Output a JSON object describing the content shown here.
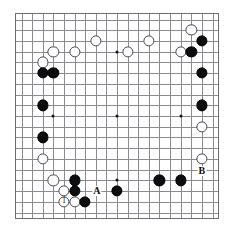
{
  "diagram": {
    "type": "go-board-diagram",
    "board_size": 19,
    "colors": {
      "board_background": "#ffffff",
      "grid_line": "#8a8a90",
      "border": "#6b6b73",
      "black_stone": "#0d0d10",
      "white_stone": "#ffffff",
      "white_stone_outline": "#4a4a52",
      "label_text": "#0d0d10"
    },
    "star_points": [
      {
        "col": 3,
        "row": 3
      },
      {
        "col": 9,
        "row": 3
      },
      {
        "col": 15,
        "row": 3
      },
      {
        "col": 3,
        "row": 9
      },
      {
        "col": 9,
        "row": 9
      },
      {
        "col": 15,
        "row": 9
      },
      {
        "col": 3,
        "row": 15
      },
      {
        "col": 9,
        "row": 15
      },
      {
        "col": 15,
        "row": 15
      }
    ],
    "stones": [
      {
        "col": 16,
        "row": 1,
        "color": "white",
        "label": ""
      },
      {
        "col": 17,
        "row": 2,
        "color": "black",
        "label": ""
      },
      {
        "col": 7,
        "row": 2,
        "color": "white",
        "label": ""
      },
      {
        "col": 12,
        "row": 2,
        "color": "white",
        "label": ""
      },
      {
        "col": 3,
        "row": 3,
        "color": "white",
        "label": ""
      },
      {
        "col": 5,
        "row": 3,
        "color": "white",
        "label": ""
      },
      {
        "col": 10,
        "row": 3,
        "color": "white",
        "label": ""
      },
      {
        "col": 15,
        "row": 3,
        "color": "white",
        "label": ""
      },
      {
        "col": 16,
        "row": 3,
        "color": "black",
        "label": ""
      },
      {
        "col": 2,
        "row": 4,
        "color": "white",
        "label": ""
      },
      {
        "col": 2,
        "row": 5,
        "color": "black",
        "label": ""
      },
      {
        "col": 3,
        "row": 5,
        "color": "black",
        "label": ""
      },
      {
        "col": 17,
        "row": 5,
        "color": "black",
        "label": ""
      },
      {
        "col": 2,
        "row": 8,
        "color": "black",
        "label": ""
      },
      {
        "col": 17,
        "row": 8,
        "color": "black",
        "label": ""
      },
      {
        "col": 17,
        "row": 10,
        "color": "white",
        "label": ""
      },
      {
        "col": 2,
        "row": 11,
        "color": "black",
        "label": ""
      },
      {
        "col": 2,
        "row": 13,
        "color": "white",
        "label": ""
      },
      {
        "col": 17,
        "row": 13,
        "color": "white",
        "label": ""
      },
      {
        "col": 3,
        "row": 15,
        "color": "white",
        "label": ""
      },
      {
        "col": 5,
        "row": 15,
        "color": "black",
        "label": ""
      },
      {
        "col": 13,
        "row": 15,
        "color": "black",
        "label": ""
      },
      {
        "col": 15,
        "row": 15,
        "color": "black",
        "label": ""
      },
      {
        "col": 4,
        "row": 16,
        "color": "white",
        "label": ""
      },
      {
        "col": 5,
        "row": 16,
        "color": "black",
        "label": ""
      },
      {
        "col": 9,
        "row": 16,
        "color": "black",
        "label": ""
      },
      {
        "col": 4,
        "row": 17,
        "color": "white",
        "label": "1"
      },
      {
        "col": 5,
        "row": 17,
        "color": "white",
        "label": ""
      },
      {
        "col": 6,
        "row": 17,
        "color": "black",
        "label": ""
      }
    ],
    "labels": [
      {
        "text": "A",
        "col": 7.1,
        "row": 16.0
      },
      {
        "text": "B",
        "col": 17.0,
        "row": 14.1
      }
    ]
  }
}
